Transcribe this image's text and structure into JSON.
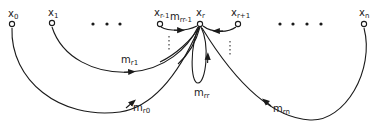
{
  "diagram": {
    "type": "directed-graph",
    "colors": {
      "stroke": "#1a1a1a",
      "background": "#ffffff"
    },
    "nodes": [
      {
        "id": "x0",
        "base": "x",
        "sub": "0",
        "cx": 12,
        "cy": 24
      },
      {
        "id": "x1",
        "base": "x",
        "sub": "1",
        "cx": 52,
        "cy": 23
      },
      {
        "id": "xr-1",
        "base": "x",
        "sub": "r-1",
        "cx": 160,
        "cy": 24
      },
      {
        "id": "xr",
        "base": "x",
        "sub": "r",
        "cx": 200,
        "cy": 24
      },
      {
        "id": "xr+1",
        "base": "x",
        "sub": "r+1",
        "cx": 238,
        "cy": 24
      },
      {
        "id": "xn",
        "base": "x",
        "sub": "n",
        "cx": 364,
        "cy": 24
      }
    ],
    "ellipsis_left": "• • •",
    "ellipsis_right": "• • • •",
    "edges": [
      {
        "from": "x1",
        "to": "xr",
        "label_base": "m",
        "label_sub": "r1"
      },
      {
        "from": "x0",
        "to": "xr",
        "label_base": "m",
        "label_sub": "r0"
      },
      {
        "from": "xr-1",
        "to": "xr",
        "label_base": "m",
        "label_sub": "rr-1"
      },
      {
        "from": "xr+1",
        "to": "xr",
        "label_base": "",
        "label_sub": ""
      },
      {
        "from": "xr",
        "to": "xr",
        "label_base": "m",
        "label_sub": "rr"
      },
      {
        "from": "xn",
        "to": "xr",
        "label_base": "m",
        "label_sub": "rn"
      }
    ]
  }
}
